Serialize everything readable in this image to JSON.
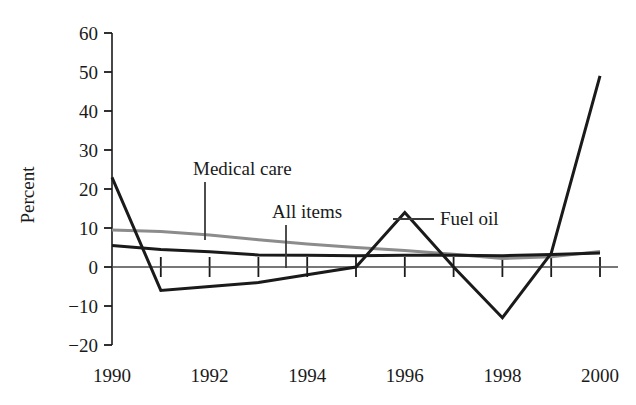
{
  "chart_data": {
    "type": "line",
    "title": "",
    "xlabel": "",
    "ylabel": "Percent",
    "xlim": [
      1990,
      2000
    ],
    "ylim": [
      -20,
      60
    ],
    "grid": false,
    "legend_position": "inline-annotations",
    "x": [
      1990,
      1991,
      1992,
      1993,
      1994,
      1995,
      1996,
      1997,
      1998,
      1999,
      2000
    ],
    "x_tick_labels": [
      "1990",
      "1992",
      "1994",
      "1996",
      "1998",
      "2000"
    ],
    "x_tick_values": [
      1990,
      1992,
      1994,
      1996,
      1998,
      2000
    ],
    "y_tick_labels": [
      "60",
      "50",
      "40",
      "30",
      "20",
      "10",
      "0",
      "−10",
      "−20"
    ],
    "y_tick_values": [
      60,
      50,
      40,
      30,
      20,
      10,
      0,
      -10,
      -20
    ],
    "series": [
      {
        "name": "Fuel oil",
        "color": "#1a1a1a",
        "width": 3.0,
        "values": [
          23,
          -6,
          -5,
          -4,
          -2,
          0,
          14,
          0,
          -13,
          3.5,
          49
        ]
      },
      {
        "name": "All items",
        "color": "#1a1a1a",
        "width": 3.0,
        "values": [
          5.5,
          4.5,
          3.9,
          3.1,
          3.0,
          2.9,
          3.0,
          3.0,
          2.9,
          3.2,
          3.6
        ]
      },
      {
        "name": "Medical care",
        "color": "#8c8c8c",
        "width": 3.0,
        "values": [
          9.5,
          9.1,
          8.2,
          7.0,
          5.9,
          5.0,
          4.2,
          3.3,
          2.2,
          2.6,
          4.0
        ]
      }
    ],
    "annotations": [
      {
        "label": "Medical care",
        "text_x": 193,
        "text_y": 175,
        "leader": {
          "x1": 205,
          "y1": 182,
          "x2": 205,
          "y2": 240
        }
      },
      {
        "label": "All items",
        "text_x": 272,
        "text_y": 218,
        "leader": {
          "x1": 286,
          "y1": 225,
          "x2": 286,
          "y2": 268
        }
      },
      {
        "label": "Fuel oil",
        "text_x": 440,
        "text_y": 225,
        "leader": {
          "x1": 393,
          "y1": 219,
          "x2": 434,
          "y2": 219
        }
      }
    ]
  },
  "axes": {
    "y_label": "Percent"
  }
}
